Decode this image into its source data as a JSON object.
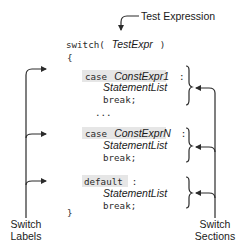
{
  "annotations": {
    "test_expression": "Test Expression",
    "switch_labels": [
      "Switch",
      "Labels"
    ],
    "switch_sections": [
      "Switch",
      "Sections"
    ]
  },
  "code": {
    "switch_keyword": "switch(",
    "test_expr": "TestExpr",
    "close_paren": ")",
    "open_brace": "{",
    "close_brace": "}",
    "ellipsis": "...",
    "sections": [
      {
        "label_keyword": "case",
        "label_expr": "ConstExpr1",
        "label_colon": ":",
        "statement": "StatementList",
        "break": "break;"
      },
      {
        "label_keyword": "case",
        "label_expr": "ConstExprN",
        "label_colon": ":",
        "statement": "StatementList",
        "break": "break;"
      },
      {
        "label_keyword": "default",
        "label_expr": "",
        "label_colon": ":",
        "statement": "StatementList",
        "break": "break;"
      }
    ]
  },
  "colors": {
    "highlight": "#e6e6e6",
    "line": "#2b2b2b"
  }
}
